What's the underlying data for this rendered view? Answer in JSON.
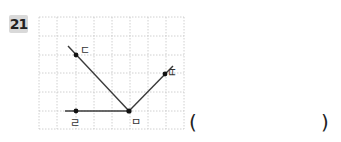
{
  "question": {
    "number": "21",
    "answer_open": "(",
    "answer_close": ")",
    "answer_value": ""
  },
  "figure": {
    "grid": {
      "columns": 8,
      "rows": 6,
      "line_color": "#bbbbbb",
      "line_style": "dotted"
    },
    "vertex": {
      "label": "ㅁ"
    },
    "rays": [
      {
        "label": "ㄷ",
        "direction": "up-left"
      },
      {
        "label": "ㄹ",
        "direction": "left"
      },
      {
        "label": "ㅂ",
        "direction": "up-right"
      }
    ],
    "colors": {
      "line": "#333333",
      "point": "#111111"
    }
  }
}
